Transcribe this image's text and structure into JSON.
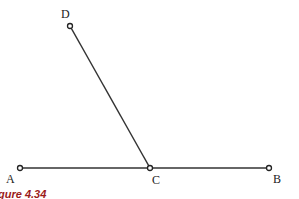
{
  "figure": {
    "caption": "gure 4.34",
    "points": {
      "A": {
        "label": "A",
        "x": 20,
        "y": 168
      },
      "B": {
        "label": "B",
        "x": 269,
        "y": 168
      },
      "C": {
        "label": "C",
        "x": 150,
        "y": 168
      },
      "D": {
        "label": "D",
        "x": 70,
        "y": 26
      }
    },
    "segments": [
      {
        "from": "A",
        "to": "B"
      },
      {
        "from": "D",
        "to": "C"
      }
    ],
    "colors": {
      "line": "#333333",
      "caption": "#9b1b1b"
    }
  }
}
